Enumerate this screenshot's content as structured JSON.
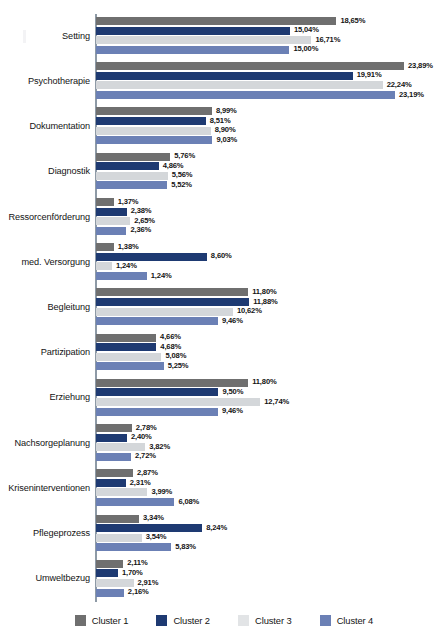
{
  "chart_data": {
    "type": "bar",
    "orientation": "horizontal",
    "title": "",
    "xlabel": "",
    "ylabel": "",
    "xlim": [
      0,
      23.89
    ],
    "grid": false,
    "value_suffix": "%",
    "decimal_separator": ",",
    "legend_position": "bottom",
    "categories": [
      "Setting",
      "Psychotherapie",
      "Dokumentation",
      "Diagnostik",
      "Ressorcenförderung",
      "med. Versorgung",
      "Begleitung",
      "Partizipation",
      "Erziehung",
      "Nachsorgeplanung",
      "Kriseninterventionen",
      "Pflegeprozess",
      "Umweltbezug"
    ],
    "series": [
      {
        "name": "Cluster 1",
        "color": "#6f6f6f",
        "values": [
          18.65,
          23.89,
          8.99,
          5.76,
          1.37,
          1.38,
          11.8,
          4.66,
          11.8,
          2.78,
          2.87,
          3.34,
          2.11
        ],
        "labels": [
          "18,65%",
          "23,89%",
          "8,99%",
          "5,76%",
          "1,37%",
          "1,38%",
          "11,80%",
          "4,66%",
          "11,80%",
          "2,78%",
          "2,87%",
          "3,34%",
          "2,11%"
        ]
      },
      {
        "name": "Cluster 2",
        "color": "#1e3a72",
        "values": [
          15.04,
          19.91,
          8.51,
          4.86,
          2.38,
          8.6,
          11.88,
          4.68,
          9.5,
          2.4,
          2.31,
          8.24,
          1.7
        ],
        "labels": [
          "15,04%",
          "19,91%",
          "8,51%",
          "4,86%",
          "2,38%",
          "8,60%",
          "11,88%",
          "4,68%",
          "9,50%",
          "2,40%",
          "2,31%",
          "8,24%",
          "1,70%"
        ]
      },
      {
        "name": "Cluster 3",
        "color": "#d4d7da",
        "values": [
          16.71,
          22.24,
          8.9,
          5.56,
          2.65,
          1.24,
          10.62,
          5.08,
          12.74,
          3.82,
          3.99,
          3.54,
          2.91
        ],
        "labels": [
          "16,71%",
          "22,24%",
          "8,90%",
          "5,56%",
          "2,65%",
          "1,24%",
          "10,62%",
          "5,08%",
          "12,74%",
          "3,82%",
          "3,99%",
          "3,54%",
          "2,91%"
        ]
      },
      {
        "name": "Cluster 4",
        "color": "#6b80b5",
        "values": [
          15.0,
          23.19,
          9.03,
          5.52,
          2.36,
          3.94,
          9.46,
          5.25,
          9.46,
          2.72,
          6.08,
          5.83,
          2.16
        ],
        "labels": [
          "15,00%",
          "23,19%",
          "9,03%",
          "5,52%",
          "2,36%",
          "1,24%",
          "9,46%",
          "5,25%",
          "9,46%",
          "2,72%",
          "6,08%",
          "5,83%",
          "2,16%"
        ]
      }
    ]
  },
  "legend": {
    "items": [
      {
        "label": "Cluster 1",
        "color": "#6f6f6f"
      },
      {
        "label": "Cluster 2",
        "color": "#1e3a72"
      },
      {
        "label": "Cluster 3",
        "color": "#e2e4e6"
      },
      {
        "label": "Cluster 4",
        "color": "#6b80b5"
      }
    ]
  }
}
